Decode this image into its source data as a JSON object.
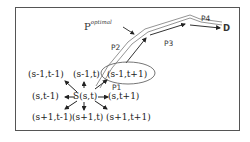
{
  "diagram": {
    "type": "path-planning neighborhood diagram",
    "nodes": {
      "top_left": "(s-1,t-1)",
      "top": "(s-1,t)",
      "top_right": "(s-1,t+1)",
      "left": "(s,t-1)",
      "center": "S(s,t)",
      "right": "(s,t+1)",
      "bottom_left": "(s+1,t-1)",
      "bottom": "(s+1,t)",
      "bottom_right": "(s+1,t+1)"
    },
    "path_labels": {
      "p1": "P1",
      "p2": "P2",
      "p3": "P3",
      "p4": "P4"
    },
    "destination": "D",
    "optimal_path": {
      "base": "P",
      "superscript": "optimal"
    },
    "colors": {
      "frame": "#555555",
      "text": "#222222",
      "arrows": "#222222",
      "ellipse": "#666666",
      "optimal_band": "#888888"
    }
  }
}
